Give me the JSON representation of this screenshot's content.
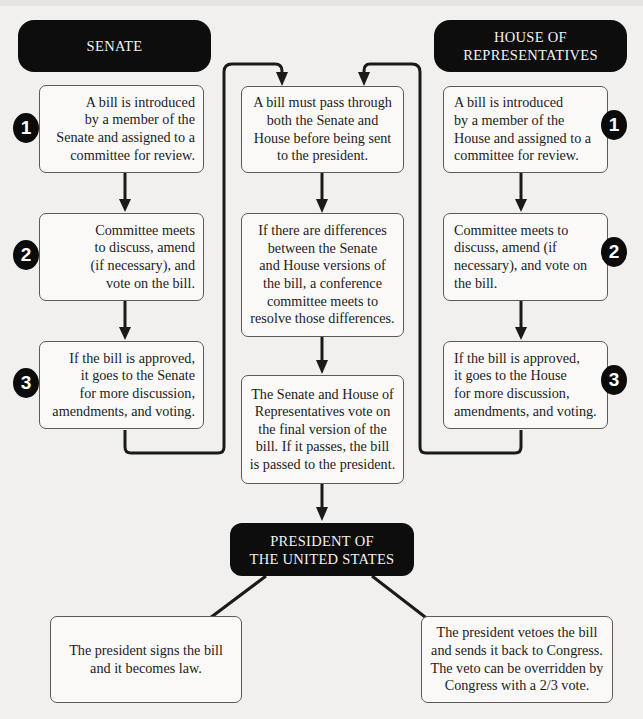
{
  "diagram": {
    "title_strip_text": "",
    "senate": {
      "header": "SENATE",
      "steps": [
        {
          "number": "1",
          "text": "A bill is introduced\nby a member of the\nSenate and assigned to a\ncommittee for review."
        },
        {
          "number": "2",
          "text": "Committee meets\nto discuss, amend\n(if necessary), and\nvote on the bill."
        },
        {
          "number": "3",
          "text": "If the bill is approved,\nit goes to the Senate\nfor more discussion,\namendments, and voting."
        }
      ]
    },
    "house": {
      "header": "HOUSE OF\nREPRESENTATIVES",
      "steps": [
        {
          "number": "1",
          "text": "A bill is introduced\nby a member of the\nHouse and assigned to a\ncommittee for review."
        },
        {
          "number": "2",
          "text": "Committee meets to\ndiscuss, amend (if\nnecessary), and vote on\nthe bill."
        },
        {
          "number": "3",
          "text": "If the bill is approved,\nit goes to the House\nfor more discussion,\namendments, and voting."
        }
      ]
    },
    "center": {
      "steps": [
        {
          "text": "A bill must pass through\nboth the Senate and\nHouse before being sent\nto the president."
        },
        {
          "text": "If there are differences\nbetween the Senate\nand House versions of\nthe bill, a conference\ncommittee meets to\nresolve those differences."
        },
        {
          "text": "The Senate and House of\nRepresentatives vote on\nthe final version of the\nbill. If it passes, the bill\nis passed to the president."
        }
      ]
    },
    "president": {
      "header": "PRESIDENT OF\nTHE UNITED STATES",
      "outcomes": [
        {
          "text": "The president signs the bill\nand it becomes law."
        },
        {
          "text": "The president vetoes the bill\nand sends it back to Congress.\nThe veto can be overridden by\nCongress with a 2/3 vote."
        }
      ]
    },
    "colors": {
      "header_bg": "#0d0d0d",
      "header_text": "#f2f2f2",
      "box_border": "#5a5a5a",
      "box_bg": "#faf9f7",
      "page_bg": "#f1f0ee",
      "line": "#1a1a1a"
    }
  }
}
